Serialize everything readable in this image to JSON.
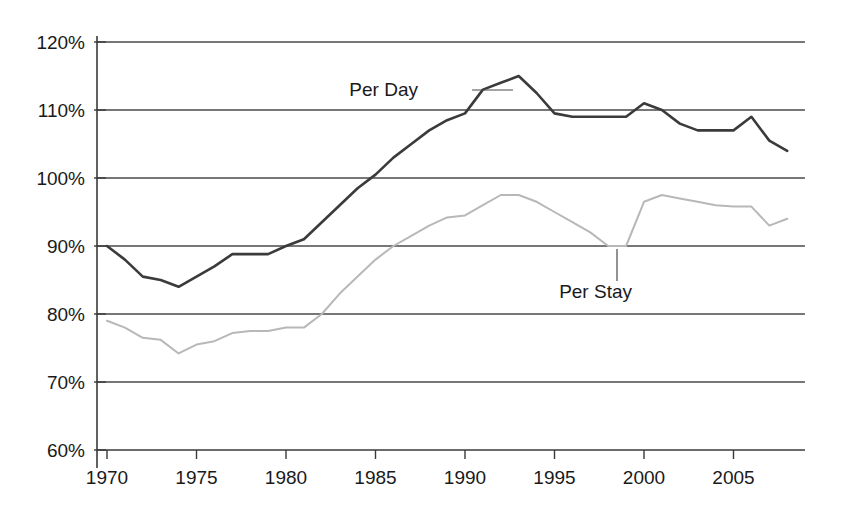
{
  "chart_data": {
    "type": "line",
    "title": "",
    "subtitle": "",
    "xlabel": "",
    "ylabel": "",
    "xlim": [
      1969,
      2009
    ],
    "ylim": [
      60,
      120
    ],
    "grid": true,
    "y_tick_labels": [
      "120%",
      "110%",
      "100%",
      "90%",
      "80%",
      "70%",
      "60%"
    ],
    "y_tick_values": [
      120,
      110,
      100,
      90,
      80,
      70,
      60
    ],
    "x_tick_labels": [
      "1970",
      "1975",
      "1980",
      "1985",
      "1990",
      "1995",
      "2000",
      "2005"
    ],
    "x_tick_values": [
      1970,
      1975,
      1980,
      1985,
      1990,
      1995,
      2000,
      2005
    ],
    "legend_position": "inline-annotation",
    "series": [
      {
        "name": "Per Day",
        "color": "#3b3b3b",
        "x": [
          1970,
          1971,
          1972,
          1973,
          1974,
          1975,
          1976,
          1977,
          1978,
          1979,
          1980,
          1981,
          1982,
          1983,
          1984,
          1985,
          1986,
          1987,
          1988,
          1989,
          1990,
          1991,
          1992,
          1993,
          1994,
          1995,
          1996,
          1997,
          1998,
          1999,
          2000,
          2001,
          2002,
          2003,
          2004,
          2005,
          2006,
          2007,
          2008
        ],
        "values": [
          90,
          88,
          85.5,
          85,
          84,
          85.5,
          87,
          88.8,
          88.8,
          88.8,
          90,
          91,
          93.5,
          96,
          98.5,
          100.5,
          103,
          105,
          107,
          108.5,
          109.5,
          113,
          114,
          115,
          112.5,
          109.5,
          109,
          109,
          109,
          109,
          111,
          110,
          108,
          107,
          107,
          107,
          109,
          105.5,
          104
        ]
      },
      {
        "name": "Per Stay",
        "color": "#b8b8b8",
        "x": [
          1970,
          1971,
          1972,
          1973,
          1974,
          1975,
          1976,
          1977,
          1978,
          1979,
          1980,
          1981,
          1982,
          1983,
          1984,
          1985,
          1986,
          1987,
          1988,
          1989,
          1990,
          1991,
          1992,
          1993,
          1994,
          1995,
          1996,
          1997,
          1998,
          1999,
          2000,
          2001,
          2002,
          2003,
          2004,
          2005,
          2006,
          2007,
          2008
        ],
        "values": [
          79,
          78,
          76.5,
          76.2,
          74.2,
          75.5,
          76,
          77.2,
          77.5,
          77.5,
          78,
          78,
          80,
          83,
          85.5,
          88,
          90,
          91.5,
          93,
          94.2,
          94.5,
          96,
          97.5,
          97.5,
          96.5,
          95,
          93.5,
          92,
          90,
          90,
          96.5,
          97.5,
          97,
          96.5,
          96,
          95.8,
          95.8,
          93,
          94
        ]
      }
    ],
    "annotations": [
      {
        "label": "Per Day",
        "text_x": 418,
        "text_y": 96,
        "leader": {
          "x1": 472,
          "y1": 90,
          "x2": 513,
          "y2": 90
        }
      },
      {
        "label": "Per Stay",
        "text_x": 632,
        "text_y": 298,
        "leader": {
          "x1": 617,
          "y1": 249,
          "x2": 617,
          "y2": 281
        }
      }
    ]
  },
  "geometry": {
    "plot_left": 107,
    "plot_right": 805,
    "plot_top": 42,
    "plot_bottom": 450,
    "axis_x": 97,
    "px_per_year": 17.9,
    "px_per_percent": 6.8
  }
}
